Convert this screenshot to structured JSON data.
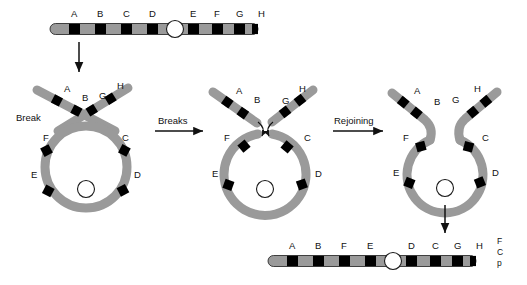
{
  "figure": {
    "background_color": "#ffffff",
    "chromatid_color": "#9a9a9a",
    "band_color": "#000000",
    "centromere_fill": "#ffffff",
    "outline_color": "#000000"
  },
  "panels": {
    "top_chromosome": {
      "name": "normal-chromosome",
      "labels": [
        "A",
        "B",
        "C",
        "D",
        "E",
        "F",
        "G",
        "H"
      ],
      "centromere": "centromere",
      "order_text": "A B C D - E F G H"
    },
    "loop_panel": {
      "name": "loop-with-crossover",
      "labels": [
        "A",
        "B",
        "G",
        "H",
        "F",
        "C",
        "E",
        "D"
      ],
      "break_label": "Break"
    },
    "broken_panel": {
      "name": "loop-broken-arms",
      "labels": [
        "A",
        "B",
        "G",
        "H",
        "F",
        "C",
        "E",
        "D"
      ]
    },
    "rejoined_panel": {
      "name": "loop-rejoined",
      "labels": [
        "A",
        "B",
        "G",
        "H",
        "F",
        "C",
        "E",
        "D"
      ]
    },
    "result_chromosome": {
      "name": "inverted-chromosome",
      "labels": [
        "A",
        "B",
        "F",
        "E",
        "D",
        "C",
        "G",
        "H"
      ],
      "order_text": "A B F E - D C G H"
    }
  },
  "process_arrows": {
    "down_first": "",
    "breaks": "Breaks",
    "rejoining": "Rejoining",
    "down_last": ""
  },
  "caption": {
    "line1": "F",
    "line2": "C",
    "line3": "p"
  }
}
